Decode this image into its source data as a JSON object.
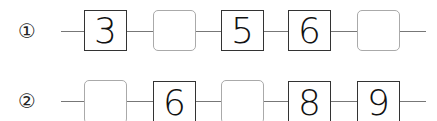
{
  "rows": [
    {
      "label": "①",
      "cells": [
        {
          "value": "3",
          "filled": true
        },
        {
          "value": "",
          "filled": false
        },
        {
          "value": "5",
          "filled": true
        },
        {
          "value": "6",
          "filled": true
        },
        {
          "value": "",
          "filled": false
        }
      ]
    },
    {
      "label": "②",
      "cells": [
        {
          "value": "",
          "filled": false
        },
        {
          "value": "6",
          "filled": true
        },
        {
          "value": "",
          "filled": false
        },
        {
          "value": "8",
          "filled": true
        },
        {
          "value": "9",
          "filled": true
        }
      ]
    }
  ]
}
